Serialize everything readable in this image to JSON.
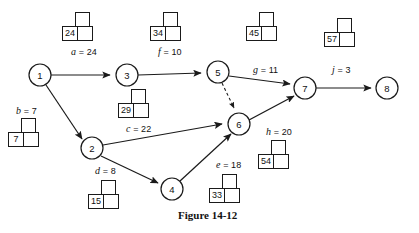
{
  "figure": {
    "caption": "Figure 14-12",
    "caption_x": 178,
    "caption_y": 209
  },
  "nodes": [
    {
      "id": "1",
      "label": "1",
      "cx": 40,
      "cy": 75,
      "r": 11
    },
    {
      "id": "2",
      "label": "2",
      "cx": 92,
      "cy": 148,
      "r": 11
    },
    {
      "id": "3",
      "label": "3",
      "cx": 127,
      "cy": 75,
      "r": 11
    },
    {
      "id": "4",
      "label": "4",
      "cx": 172,
      "cy": 189,
      "r": 11
    },
    {
      "id": "5",
      "label": "5",
      "cx": 218,
      "cy": 72,
      "r": 11
    },
    {
      "id": "6",
      "label": "6",
      "cx": 239,
      "cy": 124,
      "r": 11
    },
    {
      "id": "7",
      "label": "7",
      "cx": 305,
      "cy": 88,
      "r": 11
    },
    {
      "id": "8",
      "label": "8",
      "cx": 387,
      "cy": 88,
      "r": 11
    }
  ],
  "edges": [
    {
      "name": "a",
      "from": "1",
      "to": "3",
      "style": "solid",
      "arrow": true
    },
    {
      "name": "b",
      "from": "1",
      "to": "2",
      "style": "solid",
      "arrow": true
    },
    {
      "name": "f",
      "from": "3",
      "to": "5",
      "style": "solid",
      "arrow": true
    },
    {
      "name": "c",
      "from": "2",
      "to": "6",
      "style": "solid",
      "arrow": true
    },
    {
      "name": "d",
      "from": "2",
      "to": "4",
      "style": "solid",
      "arrow": true
    },
    {
      "name": "dummy",
      "from": "5",
      "to": "6",
      "style": "dashed",
      "arrow": true
    },
    {
      "name": "g",
      "from": "5",
      "to": "7",
      "style": "solid",
      "arrow": true
    },
    {
      "name": "e",
      "from": "4",
      "to": "6",
      "style": "solid",
      "arrow": true
    },
    {
      "name": "h",
      "from": "6",
      "to": "7",
      "style": "solid",
      "arrow": true
    },
    {
      "name": "j",
      "from": "7",
      "to": "8",
      "style": "solid",
      "arrow": true
    }
  ],
  "edge_labels": [
    {
      "id": "a",
      "var": "a",
      "eq": " = 24",
      "x": 71,
      "y": 46
    },
    {
      "id": "b",
      "var": "b",
      "eq": " = 7",
      "x": 16,
      "y": 105
    },
    {
      "id": "f",
      "var": "f",
      "eq": " = 10",
      "x": 158,
      "y": 46
    },
    {
      "id": "c",
      "var": "c",
      "eq": " = 22",
      "x": 126,
      "y": 123
    },
    {
      "id": "d",
      "var": "d",
      "eq": " = 8",
      "x": 95,
      "y": 165
    },
    {
      "id": "e",
      "var": "e",
      "eq": " = 18",
      "x": 216,
      "y": 159
    },
    {
      "id": "g",
      "var": "g",
      "eq": " = 11",
      "x": 253,
      "y": 64
    },
    {
      "id": "h",
      "var": "h",
      "eq": " = 20",
      "x": 266,
      "y": 126
    },
    {
      "id": "j",
      "var": "j",
      "eq": " = 3",
      "x": 332,
      "y": 64
    }
  ],
  "value_widgets": [
    {
      "id": "a",
      "value": "24",
      "x": 62,
      "y": 12
    },
    {
      "id": "f",
      "value": "34",
      "x": 150,
      "y": 12
    },
    {
      "id": "g",
      "value": "45",
      "x": 246,
      "y": 12
    },
    {
      "id": "j",
      "value": "57",
      "x": 324,
      "y": 18
    },
    {
      "id": "c",
      "value": "29",
      "x": 118,
      "y": 89
    },
    {
      "id": "b",
      "value": "7",
      "x": 8,
      "y": 118
    },
    {
      "id": "h",
      "value": "54",
      "x": 258,
      "y": 140
    },
    {
      "id": "d",
      "value": "15",
      "x": 88,
      "y": 180
    },
    {
      "id": "e",
      "value": "33",
      "x": 209,
      "y": 174
    }
  ],
  "colors": {
    "ink": "#1a1a1a",
    "paper": "#ffffff"
  }
}
